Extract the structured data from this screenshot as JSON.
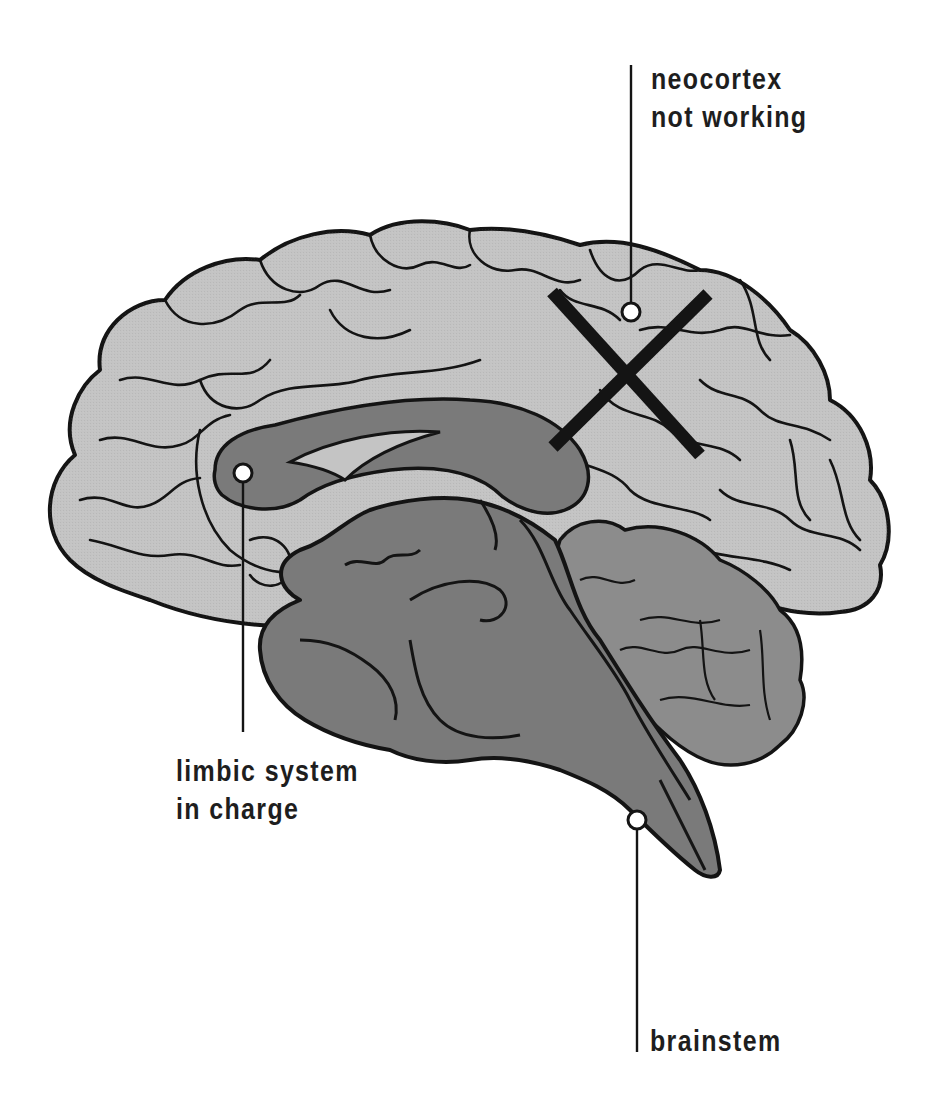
{
  "diagram": {
    "type": "anatomical-illustration",
    "colors": {
      "background": "#ffffff",
      "cortex_fill": "#c4c4c4",
      "limbic_fill": "#7a7a7a",
      "cerebellum_fill": "#8c8c8c",
      "outline": "#141414",
      "marker_fill": "#ffffff",
      "cross": "#141414",
      "text": "#1e1e1e"
    },
    "labels": {
      "neocortex": {
        "line1": "neocortex",
        "line2": "not working"
      },
      "limbic": {
        "line1": "limbic system",
        "line2": "in charge"
      },
      "brainstem": {
        "line1": "brainstem"
      }
    },
    "annotations": [
      {
        "target": "neocortex",
        "marker": "circle",
        "overlay": "X (crossed out)"
      },
      {
        "target": "limbic system",
        "marker": "circle"
      },
      {
        "target": "brainstem",
        "marker": "circle"
      }
    ]
  }
}
